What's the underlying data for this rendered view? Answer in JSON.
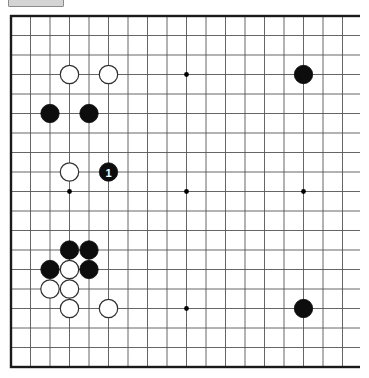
{
  "toolbar": {
    "chip_label": ""
  },
  "board": {
    "title": "Go board diagram",
    "size": 19,
    "origin_x": 4,
    "origin_y": 4,
    "spacing": 19.5,
    "stone_radius": 9.2,
    "grid_color": "#555555",
    "grid_line_width": 0.9,
    "border_color": "#1a1a1a",
    "border_line_width": 2.4,
    "background_color": "#ffffff",
    "star_point_color": "#000000",
    "star_point_radius": 2.4,
    "star_points": [
      [
        3,
        3
      ],
      [
        9,
        3
      ],
      [
        15,
        3
      ],
      [
        3,
        9
      ],
      [
        9,
        9
      ],
      [
        15,
        9
      ],
      [
        3,
        15
      ],
      [
        9,
        15
      ],
      [
        15,
        15
      ]
    ],
    "black_color": "#0d0d0d",
    "white_color": "#ffffff",
    "white_outline_color": "#303030",
    "stones": [
      {
        "color": "white",
        "col": 3,
        "row": 3,
        "label": ""
      },
      {
        "color": "white",
        "col": 5,
        "row": 3,
        "label": ""
      },
      {
        "color": "black",
        "col": 15,
        "row": 3,
        "label": ""
      },
      {
        "color": "black",
        "col": 2,
        "row": 5,
        "label": ""
      },
      {
        "color": "black",
        "col": 4,
        "row": 5,
        "label": ""
      },
      {
        "color": "white",
        "col": 3,
        "row": 8,
        "label": ""
      },
      {
        "color": "black",
        "col": 5,
        "row": 8,
        "label": "1"
      },
      {
        "color": "black",
        "col": 3,
        "row": 12,
        "label": ""
      },
      {
        "color": "black",
        "col": 4,
        "row": 12,
        "label": ""
      },
      {
        "color": "black",
        "col": 2,
        "row": 13,
        "label": ""
      },
      {
        "color": "white",
        "col": 3,
        "row": 13,
        "label": ""
      },
      {
        "color": "black",
        "col": 4,
        "row": 13,
        "label": ""
      },
      {
        "color": "white",
        "col": 2,
        "row": 14,
        "label": ""
      },
      {
        "color": "white",
        "col": 3,
        "row": 14,
        "label": ""
      },
      {
        "color": "white",
        "col": 3,
        "row": 15,
        "label": ""
      },
      {
        "color": "white",
        "col": 5,
        "row": 15,
        "label": ""
      },
      {
        "color": "black",
        "col": 15,
        "row": 15,
        "label": ""
      }
    ],
    "move_number_label": "1"
  }
}
